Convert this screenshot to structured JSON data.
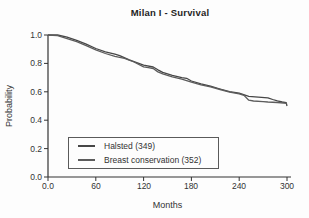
{
  "chart_data": {
    "type": "line",
    "title": "Milan I - Survival",
    "xlabel": "Months",
    "ylabel": "Probability",
    "xlim": [
      0,
      300
    ],
    "ylim": [
      0.0,
      1.0
    ],
    "grid": false,
    "legend_position": "inside-lower-left",
    "x_ticks": [
      "0.0",
      "60",
      "120",
      "180",
      "240",
      "300"
    ],
    "y_ticks": [
      "1.0",
      "0.8",
      "0.6",
      "0.4",
      "0.2",
      "0.0"
    ],
    "axis_color": "#333333",
    "series": [
      {
        "name": "Halsted (349)",
        "color": "#474747",
        "x": [
          0,
          12,
          24,
          36,
          48,
          60,
          72,
          84,
          90,
          102,
          114,
          120,
          132,
          138,
          144,
          156,
          168,
          174,
          180,
          192,
          204,
          216,
          228,
          240,
          252,
          264,
          276,
          282,
          288,
          294,
          299,
          300
        ],
        "y": [
          1.0,
          1.0,
          0.985,
          0.963,
          0.935,
          0.905,
          0.882,
          0.865,
          0.855,
          0.825,
          0.8,
          0.787,
          0.775,
          0.755,
          0.737,
          0.716,
          0.7,
          0.695,
          0.676,
          0.656,
          0.64,
          0.62,
          0.601,
          0.59,
          0.568,
          0.563,
          0.558,
          0.546,
          0.536,
          0.528,
          0.524,
          0.5
        ]
      },
      {
        "name": "Breast conservation (352)",
        "color": "#5c5c5c",
        "x": [
          0,
          12,
          24,
          36,
          48,
          60,
          72,
          84,
          96,
          108,
          120,
          126,
          132,
          138,
          144,
          156,
          168,
          180,
          192,
          204,
          216,
          228,
          240,
          246,
          252,
          258,
          270,
          276,
          288,
          300
        ],
        "y": [
          1.0,
          0.995,
          0.975,
          0.953,
          0.925,
          0.895,
          0.87,
          0.85,
          0.835,
          0.81,
          0.776,
          0.77,
          0.764,
          0.74,
          0.726,
          0.705,
          0.689,
          0.668,
          0.649,
          0.635,
          0.616,
          0.598,
          0.585,
          0.575,
          0.541,
          0.535,
          0.531,
          0.528,
          0.525,
          0.518
        ]
      }
    ]
  }
}
